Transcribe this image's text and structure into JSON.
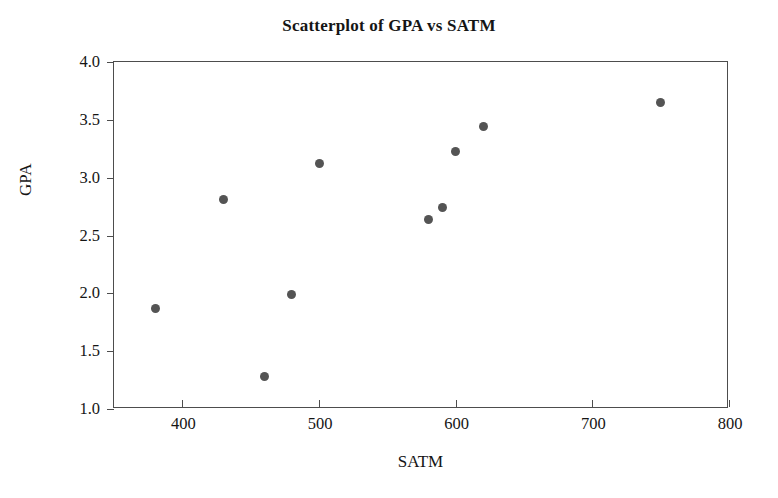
{
  "chart_data": {
    "type": "scatter",
    "title": "Scatterplot of GPA vs SATM",
    "xlabel": "SATM",
    "ylabel": "GPA",
    "xlim": [
      350,
      800
    ],
    "ylim": [
      1.0,
      4.0
    ],
    "xticks": [
      400,
      500,
      600,
      700,
      800
    ],
    "xtick_labels": [
      "400",
      "500",
      "600",
      "700",
      "800"
    ],
    "yticks": [
      1.0,
      1.5,
      2.0,
      2.5,
      3.0,
      3.5,
      4.0
    ],
    "ytick_labels": [
      "1.0",
      "1.5",
      "2.0",
      "2.5",
      "3.0",
      "3.5",
      "4.0"
    ],
    "grid": false,
    "legend": false,
    "marker_color": "#545454",
    "frame_color": "#4d4d4d",
    "points": [
      {
        "x": 380,
        "y": 1.87
      },
      {
        "x": 430,
        "y": 2.81
      },
      {
        "x": 460,
        "y": 1.28
      },
      {
        "x": 480,
        "y": 1.99
      },
      {
        "x": 500,
        "y": 3.12
      },
      {
        "x": 580,
        "y": 2.64
      },
      {
        "x": 590,
        "y": 2.74
      },
      {
        "x": 600,
        "y": 3.23
      },
      {
        "x": 620,
        "y": 3.44
      },
      {
        "x": 750,
        "y": 3.65
      }
    ]
  }
}
